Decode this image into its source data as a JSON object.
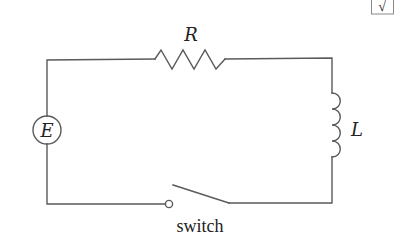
{
  "diagram": {
    "type": "RL circuit",
    "components": {
      "source": {
        "label": "E",
        "kind": "voltage-source"
      },
      "resistor": {
        "label": "R",
        "kind": "resistor"
      },
      "inductor": {
        "label": "L",
        "kind": "inductor"
      },
      "switch": {
        "label": "switch",
        "kind": "open-switch"
      }
    },
    "corner_glyph": "√",
    "colors": {
      "wire": "#5a5a5a",
      "text": "#222222",
      "background": "#ffffff"
    }
  }
}
